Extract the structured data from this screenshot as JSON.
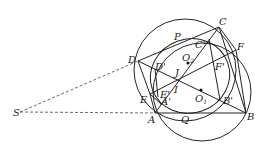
{
  "diagram": {
    "type": "geometry-figure",
    "points": {
      "S": {
        "label": "S",
        "x": 20,
        "y": 112
      },
      "A": {
        "label": "A",
        "x": 155,
        "y": 113
      },
      "B": {
        "label": "B",
        "x": 246,
        "y": 113
      },
      "C": {
        "label": "C",
        "x": 219,
        "y": 27
      },
      "D": {
        "label": "D",
        "x": 138,
        "y": 61
      },
      "E": {
        "label": "E",
        "x": 150,
        "y": 94
      },
      "F": {
        "label": "F",
        "x": 236,
        "y": 50
      },
      "P": {
        "label": "P",
        "x": 178,
        "y": 42
      },
      "Q": {
        "label": "Q",
        "x": 185,
        "y": 113
      },
      "I": {
        "label": "I",
        "x": 179,
        "y": 81
      },
      "J": {
        "label": "J",
        "x": 181,
        "y": 74
      },
      "O1": {
        "label": "O",
        "sub": "1",
        "x": 201,
        "y": 90
      },
      "O2": {
        "label": "O",
        "sub": "2",
        "x": 188,
        "y": 63
      },
      "A'": {
        "label": "A'",
        "x": 161,
        "y": 104
      },
      "B'": {
        "label": "B'",
        "x": 220,
        "y": 100
      },
      "C'": {
        "label": "C''",
        "x": 209,
        "y": 39
      },
      "D'": {
        "label": "D'",
        "x": 155,
        "y": 69
      },
      "E'": {
        "label": "E'",
        "x": 158,
        "y": 97
      },
      "F'": {
        "label": "F'",
        "x": 214,
        "y": 66
      }
    },
    "labels": {
      "S": "S",
      "A": "A",
      "B": "B",
      "C": "C",
      "D": "D",
      "E": "E",
      "F": "F",
      "P": "P",
      "Q": "Q",
      "I": "I",
      "J": "J",
      "O": "O",
      "sub1": "1",
      "sub2": "2",
      "Ap": "A'",
      "Bp": "B'",
      "Cp": "C''",
      "Dp": "D'",
      "Ep": "E'",
      "Fp": "F'"
    },
    "circles": [
      {
        "name": "circumcircle-DCFBAE",
        "cx": 186,
        "cy": 71,
        "r": 52
      },
      {
        "name": "circle-O1",
        "cx": 201,
        "cy": 90,
        "r": 50
      }
    ],
    "ellipse": {
      "name": "inscribed-ellipse-O2",
      "cx": 190,
      "cy": 76,
      "rx": 40,
      "ry": 37
    }
  }
}
